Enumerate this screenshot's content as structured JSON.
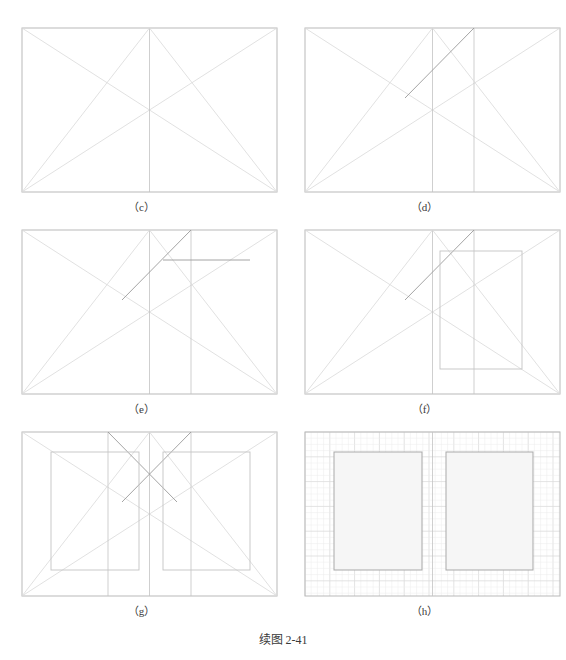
{
  "figure": {
    "caption": "续图 2-41",
    "caption_x": 0,
    "caption_y": 630,
    "width": 566,
    "height": 660,
    "background": "#ffffff",
    "colors": {
      "frame": "#b9b9b9",
      "construction_light": "#d9d9d9",
      "construction_mid": "#c3c3c3",
      "construction_dark": "#9a9a9a",
      "grid_minor": "#ececec",
      "grid_major": "#dcdcdc",
      "shade_fill": "#f6f6f6",
      "shade_stroke": "#a9a9a9",
      "label_text": "#3a3a3a"
    }
  },
  "panels": [
    {
      "id": "c",
      "label": "（c）",
      "origin_x": 0,
      "origin_y": 0,
      "frame": {
        "x": 22,
        "y": 28,
        "w": 255,
        "h": 164
      },
      "label_y": 198,
      "description": "rectangle with both full diagonals, a vertical centre line, and two lines from the top-centre point to each bottom corner",
      "lines": [
        {
          "name": "diagonal-tl-br",
          "x1": 22,
          "y1": 28,
          "x2": 277,
          "y2": 192,
          "tone": "light"
        },
        {
          "name": "diagonal-bl-tr",
          "x1": 22,
          "y1": 192,
          "x2": 277,
          "y2": 28,
          "tone": "light"
        },
        {
          "name": "centre-vertical",
          "x1": 149.5,
          "y1": 28,
          "x2": 149.5,
          "y2": 192,
          "tone": "mid"
        },
        {
          "name": "topcentre-to-bottomleft",
          "x1": 149.5,
          "y1": 28,
          "x2": 22,
          "y2": 192,
          "tone": "light"
        },
        {
          "name": "topcentre-to-bottomright",
          "x1": 149.5,
          "y1": 28,
          "x2": 277,
          "y2": 192,
          "tone": "light"
        }
      ],
      "rects": [],
      "grid": null
    },
    {
      "id": "d",
      "label": "（d）",
      "origin_x": 283,
      "origin_y": 0,
      "frame": {
        "x": 22,
        "y": 28,
        "w": 255,
        "h": 164
      },
      "label_y": 198,
      "description": "panel (c) plus a second vertical at two-thirds width and a darker ray from the left crossing point up to the top edge at that vertical",
      "lines": [
        {
          "name": "diagonal-tl-br",
          "x1": 22,
          "y1": 28,
          "x2": 277,
          "y2": 192,
          "tone": "light"
        },
        {
          "name": "diagonal-bl-tr",
          "x1": 22,
          "y1": 192,
          "x2": 277,
          "y2": 28,
          "tone": "light"
        },
        {
          "name": "centre-vertical",
          "x1": 149.5,
          "y1": 28,
          "x2": 149.5,
          "y2": 192,
          "tone": "mid"
        },
        {
          "name": "right-vertical",
          "x1": 191,
          "y1": 28,
          "x2": 191,
          "y2": 192,
          "tone": "mid"
        },
        {
          "name": "topcentre-to-bottomleft",
          "x1": 149.5,
          "y1": 28,
          "x2": 22,
          "y2": 192,
          "tone": "light"
        },
        {
          "name": "topcentre-to-bottomright",
          "x1": 149.5,
          "y1": 28,
          "x2": 277,
          "y2": 192,
          "tone": "light"
        },
        {
          "name": "construction-ray-dark",
          "x1": 122,
          "y1": 98,
          "x2": 191,
          "y2": 28,
          "tone": "dark"
        }
      ],
      "rects": [],
      "grid": null
    },
    {
      "id": "e",
      "label": "（e）",
      "origin_x": 0,
      "origin_y": 220,
      "frame": {
        "x": 22,
        "y": 10,
        "w": 255,
        "h": 164
      },
      "label_y": 180,
      "description": "panel (d) plus a horizontal construction line drawn from the ray intersection rightwards toward the right edge",
      "lines": [
        {
          "name": "diagonal-tl-br",
          "x1": 22,
          "y1": 10,
          "x2": 277,
          "y2": 174,
          "tone": "light"
        },
        {
          "name": "diagonal-bl-tr",
          "x1": 22,
          "y1": 174,
          "x2": 277,
          "y2": 10,
          "tone": "light"
        },
        {
          "name": "centre-vertical",
          "x1": 149.5,
          "y1": 10,
          "x2": 149.5,
          "y2": 174,
          "tone": "mid"
        },
        {
          "name": "right-vertical",
          "x1": 191,
          "y1": 10,
          "x2": 191,
          "y2": 174,
          "tone": "mid"
        },
        {
          "name": "topcentre-to-bottomleft",
          "x1": 149.5,
          "y1": 10,
          "x2": 22,
          "y2": 174,
          "tone": "light"
        },
        {
          "name": "topcentre-to-bottomright",
          "x1": 149.5,
          "y1": 10,
          "x2": 277,
          "y2": 174,
          "tone": "light"
        },
        {
          "name": "construction-ray-dark",
          "x1": 122,
          "y1": 80,
          "x2": 191,
          "y2": 10,
          "tone": "dark"
        },
        {
          "name": "horizontal-offset-line",
          "x1": 163,
          "y1": 40,
          "x2": 250,
          "y2": 40,
          "tone": "dark"
        }
      ],
      "rects": [],
      "grid": null
    },
    {
      "id": "f",
      "label": "（f）",
      "origin_x": 283,
      "origin_y": 220,
      "frame": {
        "x": 22,
        "y": 10,
        "w": 255,
        "h": 164
      },
      "label_y": 180,
      "description": "panel (e) with the located rectangle completed on the right-hand side of the frame",
      "lines": [
        {
          "name": "diagonal-tl-br",
          "x1": 22,
          "y1": 10,
          "x2": 277,
          "y2": 174,
          "tone": "light"
        },
        {
          "name": "diagonal-bl-tr",
          "x1": 22,
          "y1": 174,
          "x2": 277,
          "y2": 10,
          "tone": "light"
        },
        {
          "name": "centre-vertical",
          "x1": 149.5,
          "y1": 10,
          "x2": 149.5,
          "y2": 174,
          "tone": "mid"
        },
        {
          "name": "right-vertical",
          "x1": 191,
          "y1": 10,
          "x2": 191,
          "y2": 174,
          "tone": "mid"
        },
        {
          "name": "topcentre-to-bottomleft",
          "x1": 149.5,
          "y1": 10,
          "x2": 22,
          "y2": 174,
          "tone": "light"
        },
        {
          "name": "topcentre-to-bottomright",
          "x1": 149.5,
          "y1": 10,
          "x2": 277,
          "y2": 174,
          "tone": "light"
        },
        {
          "name": "construction-ray-dark",
          "x1": 122,
          "y1": 80,
          "x2": 191,
          "y2": 10,
          "tone": "dark"
        }
      ],
      "rects": [
        {
          "name": "derived-rectangle-right",
          "x": 157,
          "y": 31,
          "w": 82,
          "h": 118,
          "tone": "mid"
        }
      ],
      "grid": null
    },
    {
      "id": "g",
      "label": "（g）",
      "origin_x": 0,
      "origin_y": 420,
      "frame": {
        "x": 22,
        "y": 12,
        "w": 255,
        "h": 164
      },
      "label_y": 182,
      "description": "symmetrical construction: mirrored diagonals and rays about the centre line, producing two equal rectangles left and right",
      "lines": [
        {
          "name": "diagonal-tl-br",
          "x1": 22,
          "y1": 12,
          "x2": 277,
          "y2": 176,
          "tone": "light"
        },
        {
          "name": "diagonal-bl-tr",
          "x1": 22,
          "y1": 176,
          "x2": 277,
          "y2": 12,
          "tone": "light"
        },
        {
          "name": "centre-vertical",
          "x1": 149.5,
          "y1": 12,
          "x2": 149.5,
          "y2": 176,
          "tone": "mid"
        },
        {
          "name": "left-vertical",
          "x1": 108,
          "y1": 12,
          "x2": 108,
          "y2": 176,
          "tone": "mid"
        },
        {
          "name": "right-vertical",
          "x1": 191,
          "y1": 12,
          "x2": 191,
          "y2": 176,
          "tone": "mid"
        },
        {
          "name": "topcentre-to-bottomleft",
          "x1": 149.5,
          "y1": 12,
          "x2": 22,
          "y2": 176,
          "tone": "light"
        },
        {
          "name": "topcentre-to-bottomright",
          "x1": 149.5,
          "y1": 12,
          "x2": 277,
          "y2": 176,
          "tone": "light"
        },
        {
          "name": "construction-ray-dark-right",
          "x1": 122,
          "y1": 82,
          "x2": 191,
          "y2": 12,
          "tone": "dark"
        },
        {
          "name": "construction-ray-dark-left",
          "x1": 177,
          "y1": 82,
          "x2": 108,
          "y2": 12,
          "tone": "dark"
        }
      ],
      "rects": [
        {
          "name": "derived-rectangle-left",
          "x": 51,
          "y": 32,
          "w": 88,
          "h": 118,
          "tone": "mid"
        },
        {
          "name": "derived-rectangle-right",
          "x": 163,
          "y": 32,
          "w": 87,
          "h": 118,
          "tone": "mid"
        }
      ],
      "grid": null
    },
    {
      "id": "h",
      "label": "（h）",
      "origin_x": 283,
      "origin_y": 420,
      "frame": {
        "x": 22,
        "y": 12,
        "w": 255,
        "h": 164
      },
      "label_y": 182,
      "description": "final result drawn on a squared grid: two shaded equal rectangles placed symmetrically about the vertical centre line",
      "lines": [
        {
          "name": "centre-vertical",
          "x1": 149.5,
          "y1": 12,
          "x2": 149.5,
          "y2": 176,
          "tone": "mid"
        }
      ],
      "rects": [
        {
          "name": "shaded-rectangle-left",
          "x": 51,
          "y": 32,
          "w": 88,
          "h": 118,
          "tone": "shade"
        },
        {
          "name": "shaded-rectangle-right",
          "x": 163,
          "y": 32,
          "w": 87,
          "h": 118,
          "tone": "shade"
        }
      ],
      "grid": {
        "minor_step": 6.2,
        "major_step": 24.8,
        "x": 22,
        "y": 12,
        "w": 255,
        "h": 164
      }
    }
  ]
}
